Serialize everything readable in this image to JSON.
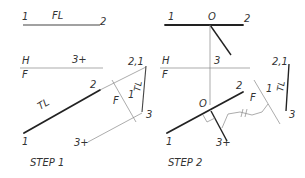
{
  "steps": [
    {
      "caption": "STEP 1",
      "labels": {
        "top_point_1": "1",
        "top_title": "FL",
        "top_point_2": "2",
        "fold_upper": "H",
        "fold_lower": "F",
        "point_3_top": "3+",
        "aux_point_21": "2,1",
        "aux_TL": "TL",
        "aux_point_3": "3",
        "fold2_F": "F",
        "fold2_1": "1",
        "front_point_2": "2",
        "front_TL": "TL",
        "front_point_1": "1",
        "front_point_3": "3+"
      }
    },
    {
      "caption": "STEP 2",
      "labels": {
        "top_point_1": "1",
        "top_point_O": "O",
        "top_point_2": "2",
        "fold_upper": "H",
        "fold_lower": "F",
        "point_3_top": "3",
        "aux_point_21": "2,1",
        "aux_TL": "TL",
        "aux_point_3": "3",
        "fold2_F": "F",
        "fold2_1": "1",
        "front_point_2": "2",
        "front_point_O": "O",
        "front_point_1": "1",
        "front_point_3": "3+"
      }
    }
  ],
  "colors": {
    "ink": "#222222",
    "projection": "#888888",
    "label": "#333333",
    "background": "#ffffff"
  }
}
